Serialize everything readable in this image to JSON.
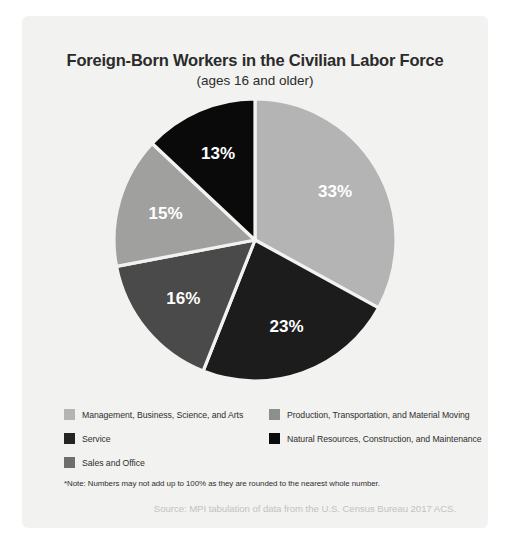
{
  "card": {
    "background": "#f2f2f0"
  },
  "chart_data": {
    "type": "pie",
    "title": "Foreign-Born Workers in the Civilian Labor Force",
    "subtitle": "(ages 16 and older)",
    "xlabel": "",
    "ylabel": "",
    "legend_position": "bottom",
    "grid": false,
    "categories": [
      "Management, Business, Science, and Arts",
      "Natural Resources, Construction, and Maintenance",
      "Sales and Office",
      "Service",
      "Production, Transportation, and Material Moving"
    ],
    "values": [
      33,
      13,
      15,
      16,
      23
    ],
    "data_labels": [
      "33%",
      "13%",
      "15%",
      "16%",
      "23%"
    ],
    "colors": [
      "#b4b4b4",
      "#0a0a0a",
      "#a0a09e",
      "#4a4a4a",
      "#1c1c1c"
    ],
    "slices": [
      {
        "label": "Management, Business, Science, and Arts",
        "value": 33,
        "display": "33%",
        "color": "#b4b4b4"
      },
      {
        "label": "Production, Transportation, and Material Moving",
        "value": 23,
        "display": "23%",
        "color": "#1c1c1c"
      },
      {
        "label": "Service",
        "value": 16,
        "display": "16%",
        "color": "#4a4a4a"
      },
      {
        "label": "Sales and Office",
        "value": 15,
        "display": "15%",
        "color": "#a0a09e"
      },
      {
        "label": "Natural Resources, Construction, and Maintenance",
        "value": 13,
        "display": "13%",
        "color": "#0a0a0a"
      }
    ],
    "note": "*Note: Numbers may not add up to 100% as they are rounded to the nearest whole number.",
    "source": "Source: MPI tabulation of data from the U.S. Census Bureau 2017 ACS."
  },
  "legend": {
    "left": [
      {
        "label": "Management, Business, Science, and Arts",
        "color": "#b4b4b4"
      },
      {
        "label": "Service",
        "color": "#242424"
      },
      {
        "label": "Sales and Office",
        "color": "#6e6e6e"
      }
    ],
    "right": [
      {
        "label": "Production, Transportation, and Material Moving",
        "color": "#8e8e8c"
      },
      {
        "label": "Natural Resources, Construction, and Maintenance",
        "color": "#0a0a0a"
      }
    ]
  }
}
